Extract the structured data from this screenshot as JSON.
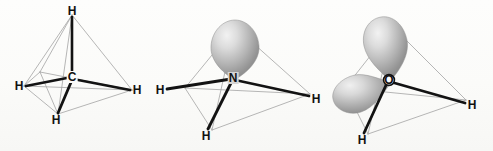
{
  "figure": {
    "background_color": "#fdfdfb",
    "bond_color": "#111111",
    "cage_color": "#9a9a9a",
    "lobe_color_light": "#e8e8e8",
    "lobe_color_mid": "#b8b8b8",
    "lobe_color_dark": "#8c8c8c",
    "label_color": "#111111"
  },
  "molecules": [
    {
      "id": "methane",
      "formula": "CH4",
      "center": {
        "label": "C",
        "x": 72,
        "y": 77
      },
      "lone_pairs": 0,
      "bonded_hydrogens": 4,
      "atoms": [
        {
          "label": "H",
          "x": 72,
          "y": 11,
          "position": "apex"
        },
        {
          "label": "H",
          "x": 19,
          "y": 86,
          "position": "left"
        },
        {
          "label": "H",
          "x": 137,
          "y": 90,
          "position": "right"
        },
        {
          "label": "H",
          "x": 56,
          "y": 120,
          "position": "bottom-front"
        }
      ],
      "cage_vertices": [
        {
          "x": 72,
          "y": 15,
          "name": "top"
        },
        {
          "x": 24,
          "y": 86,
          "name": "left"
        },
        {
          "x": 132,
          "y": 90,
          "name": "right"
        },
        {
          "x": 58,
          "y": 114,
          "name": "front-bottom"
        },
        {
          "x": 40,
          "y": 72,
          "name": "back-left"
        }
      ]
    },
    {
      "id": "ammonia",
      "formula": "NH3",
      "center": {
        "label": "N",
        "x": 233,
        "y": 78
      },
      "lone_pairs": 1,
      "bonded_hydrogens": 3,
      "atoms": [
        {
          "label": "H",
          "x": 160,
          "y": 90,
          "position": "left"
        },
        {
          "label": "H",
          "x": 316,
          "y": 99,
          "position": "right"
        },
        {
          "label": "H",
          "x": 206,
          "y": 136,
          "position": "bottom-front"
        }
      ],
      "lobes": [
        {
          "name": "lone-pair-lobe-up",
          "tip_x": 233,
          "tip_y": 76,
          "bulb_x": 235,
          "bulb_y": 47,
          "rx": 24,
          "ry": 27,
          "rotation": -4
        }
      ],
      "cage_vertices": [
        {
          "x": 235,
          "y": 27,
          "name": "top"
        },
        {
          "x": 185,
          "y": 88,
          "name": "left"
        },
        {
          "x": 310,
          "y": 94,
          "name": "right"
        },
        {
          "x": 212,
          "y": 130,
          "name": "front-bottom"
        }
      ]
    },
    {
      "id": "water",
      "formula": "H2O",
      "center": {
        "label": "O",
        "x": 389,
        "y": 80
      },
      "lone_pairs": 2,
      "bonded_hydrogens": 2,
      "atoms": [
        {
          "label": "H",
          "x": 472,
          "y": 105,
          "position": "right"
        },
        {
          "label": "H",
          "x": 362,
          "y": 140,
          "position": "bottom-front"
        }
      ],
      "lobes": [
        {
          "name": "lone-pair-lobe-up",
          "tip_x": 388,
          "tip_y": 78,
          "bulb_x": 380,
          "bulb_y": 46,
          "rx": 23,
          "ry": 28,
          "rotation": -18
        },
        {
          "name": "lone-pair-lobe-left",
          "tip_x": 386,
          "tip_y": 81,
          "bulb_x": 350,
          "bulb_y": 89,
          "rx": 25,
          "ry": 21,
          "rotation": -8
        }
      ],
      "cage_vertices": [
        {
          "x": 393,
          "y": 27,
          "name": "top"
        },
        {
          "x": 345,
          "y": 88,
          "name": "left"
        },
        {
          "x": 466,
          "y": 100,
          "name": "right"
        },
        {
          "x": 368,
          "y": 134,
          "name": "front-bottom"
        }
      ]
    }
  ]
}
